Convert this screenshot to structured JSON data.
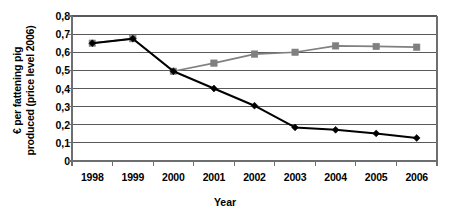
{
  "chart_data": {
    "type": "line",
    "title": "",
    "xlabel": "Year",
    "ylabel_line1": "€ per fattening pig",
    "ylabel_line2": "produced (price level 2006)",
    "categories": [
      "1998",
      "1999",
      "2000",
      "2001",
      "2002",
      "2003",
      "2004",
      "2005",
      "2006"
    ],
    "x": [
      1998,
      1999,
      2000,
      2001,
      2002,
      2003,
      2004,
      2005,
      2006
    ],
    "ylim": [
      0,
      0.8
    ],
    "ytick_values": [
      0,
      0.1,
      0.2,
      0.3,
      0.4,
      0.5,
      0.6,
      0.7,
      0.8
    ],
    "ytick_labels": [
      "0",
      "0,1",
      "0,2",
      "0,3",
      "0,4",
      "0,5",
      "0,6",
      "0,7",
      "0,8"
    ],
    "grid": true,
    "grid_axis": "y",
    "legend": false,
    "legend_position": "none",
    "decimal_separator": ",",
    "series": [
      {
        "name": "gray-square-series",
        "marker": "square",
        "color": "#808080",
        "values": [
          0.65,
          0.675,
          0.495,
          0.54,
          0.59,
          0.6,
          0.635,
          0.632,
          0.628
        ]
      },
      {
        "name": "black-diamond-series",
        "marker": "diamond",
        "color": "#000000",
        "values": [
          0.65,
          0.675,
          0.495,
          0.4,
          0.305,
          0.185,
          0.172,
          0.152,
          0.127
        ]
      }
    ]
  },
  "style": {
    "grid_color": "#58595b",
    "axis_color": "#6d6e70",
    "plot_background": "#ffffff",
    "page_background": "#ffffff"
  }
}
